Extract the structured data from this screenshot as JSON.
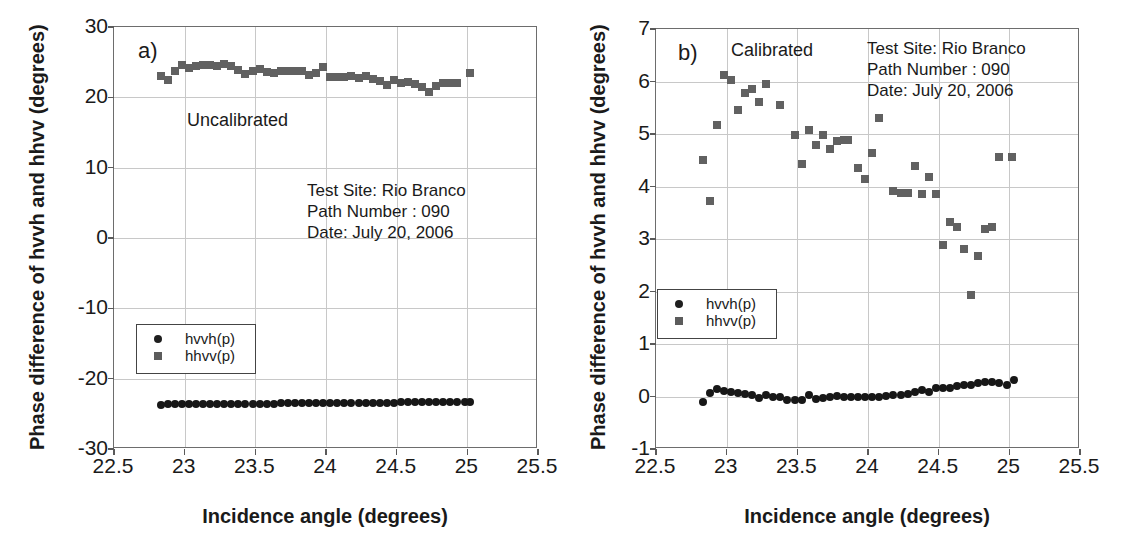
{
  "figure": {
    "background": "#ffffff",
    "marker_color_square": "#616161",
    "marker_color_circle": "#171717",
    "grid_color": "#c8c8c8",
    "frame_color": "#6d6d6d"
  },
  "panels": [
    {
      "id": "a",
      "tag": "a)",
      "state_note": "Uncalibrated",
      "xlabel": "Incidence angle (degrees)",
      "ylabel": "Phase difference of hvvh and hhvv (degrees)",
      "meta": {
        "test_site": "Test Site: Rio Branco",
        "path_number": "Path Number : 090",
        "date": "Date: July 20, 2006"
      },
      "legend": {
        "items": [
          {
            "label": "hvvh(p)",
            "marker": "circle"
          },
          {
            "label": "hhvv(p)",
            "marker": "square"
          }
        ]
      },
      "xticks": [
        "22.5",
        "23",
        "23.5",
        "24",
        "24.5",
        "25",
        "25.5"
      ],
      "yticks": [
        "30",
        "20",
        "10",
        "0",
        "-10",
        "-20",
        "-30"
      ]
    },
    {
      "id": "b",
      "tag": "b)",
      "state_note": "Calibrated",
      "xlabel": "Incidence angle (degrees)",
      "ylabel": "Phase difference of hvvh and hhvv (degrees)",
      "meta": {
        "test_site": "Test Site: Rio Branco",
        "path_number": "Path Number : 090",
        "date": "Date: July 20, 2006"
      },
      "legend": {
        "items": [
          {
            "label": "hvvh(p)",
            "marker": "circle"
          },
          {
            "label": "hhvv(p)",
            "marker": "square"
          }
        ]
      },
      "xticks": [
        "22.5",
        "23",
        "23.5",
        "24",
        "24.5",
        "25",
        "25.5"
      ],
      "yticks": [
        "7",
        "6",
        "5",
        "4",
        "3",
        "2",
        "1",
        "0",
        "-1"
      ]
    }
  ],
  "chart_data": [
    {
      "type": "scatter",
      "panel": "a",
      "title": "a) Uncalibrated",
      "xlabel": "Incidence angle (degrees)",
      "ylabel": "Phase difference of hvvh and hhvv (degrees)",
      "xlim": [
        22.5,
        25.5
      ],
      "ylim": [
        -30,
        30
      ],
      "xticks": [
        22.5,
        23,
        23.5,
        24,
        24.5,
        25,
        25.5
      ],
      "yticks": [
        -30,
        -20,
        -10,
        0,
        10,
        20,
        30
      ],
      "grid": true,
      "legend_position": "lower-left",
      "annotations": [
        "Uncalibrated",
        "Test Site: Rio Branco",
        "Path Number : 090",
        "Date: July 20, 2006"
      ],
      "series": [
        {
          "name": "hhvv(p)",
          "marker": "square",
          "color": "#616161",
          "x": [
            22.83,
            22.88,
            22.93,
            22.98,
            23.03,
            23.08,
            23.13,
            23.18,
            23.23,
            23.28,
            23.33,
            23.38,
            23.43,
            23.48,
            23.53,
            23.58,
            23.63,
            23.68,
            23.73,
            23.78,
            23.83,
            23.88,
            23.93,
            23.98,
            24.03,
            24.08,
            24.13,
            24.18,
            24.23,
            24.28,
            24.33,
            24.38,
            24.43,
            24.48,
            24.53,
            24.58,
            24.63,
            24.68,
            24.73,
            24.78,
            24.83,
            24.88,
            24.93,
            25.02
          ],
          "y": [
            23.1,
            22.4,
            23.8,
            24.6,
            24.2,
            24.5,
            24.6,
            24.6,
            24.4,
            24.7,
            24.4,
            23.9,
            23.3,
            23.7,
            24.0,
            23.6,
            23.4,
            23.7,
            23.8,
            23.8,
            23.8,
            23.2,
            23.4,
            24.3,
            22.9,
            22.9,
            22.9,
            23.0,
            22.8,
            23.0,
            22.6,
            22.3,
            21.8,
            22.5,
            22.1,
            22.2,
            21.9,
            21.4,
            20.8,
            21.6,
            22.0,
            22.0,
            22.1,
            23.4
          ]
        },
        {
          "name": "hvvh(p)",
          "marker": "circle",
          "color": "#171717",
          "x": [
            22.83,
            22.88,
            22.93,
            22.98,
            23.03,
            23.08,
            23.13,
            23.18,
            23.23,
            23.28,
            23.33,
            23.38,
            23.43,
            23.48,
            23.53,
            23.58,
            23.63,
            23.68,
            23.73,
            23.78,
            23.83,
            23.88,
            23.93,
            23.98,
            24.03,
            24.08,
            24.13,
            24.18,
            24.23,
            24.28,
            24.33,
            24.38,
            24.43,
            24.48,
            24.53,
            24.58,
            24.63,
            24.68,
            24.73,
            24.78,
            24.83,
            24.88,
            24.93,
            24.98,
            25.02
          ],
          "y": [
            -23.7,
            -23.6,
            -23.6,
            -23.6,
            -23.6,
            -23.6,
            -23.6,
            -23.6,
            -23.6,
            -23.6,
            -23.6,
            -23.6,
            -23.6,
            -23.6,
            -23.6,
            -23.6,
            -23.6,
            -23.5,
            -23.5,
            -23.5,
            -23.5,
            -23.5,
            -23.5,
            -23.5,
            -23.5,
            -23.5,
            -23.5,
            -23.5,
            -23.4,
            -23.4,
            -23.4,
            -23.4,
            -23.4,
            -23.4,
            -23.3,
            -23.3,
            -23.3,
            -23.3,
            -23.3,
            -23.3,
            -23.3,
            -23.3,
            -23.3,
            -23.3,
            -23.3
          ]
        }
      ]
    },
    {
      "type": "scatter",
      "panel": "b",
      "title": "b) Calibrated",
      "xlabel": "Incidence angle (degrees)",
      "ylabel": "Phase difference of hvvh and hhvv (degrees)",
      "xlim": [
        22.5,
        25.5
      ],
      "ylim": [
        -1,
        7
      ],
      "xticks": [
        22.5,
        23,
        23.5,
        24,
        24.5,
        25,
        25.5
      ],
      "yticks": [
        -1,
        0,
        1,
        2,
        3,
        4,
        5,
        6,
        7
      ],
      "grid": true,
      "legend_position": "lower-left",
      "annotations": [
        "Calibrated",
        "Test Site: Rio Branco",
        "Path Number : 090",
        "Date: July 20, 2006"
      ],
      "series": [
        {
          "name": "hhvv(p)",
          "marker": "square",
          "color": "#616161",
          "x": [
            22.83,
            22.88,
            22.93,
            22.98,
            23.03,
            23.08,
            23.13,
            23.18,
            23.23,
            23.28,
            23.38,
            23.48,
            23.53,
            23.58,
            23.63,
            23.68,
            23.73,
            23.78,
            23.83,
            23.86,
            23.93,
            23.98,
            24.03,
            24.08,
            24.18,
            24.23,
            24.28,
            24.33,
            24.38,
            24.43,
            24.48,
            24.53,
            24.58,
            24.63,
            24.68,
            24.73,
            24.78,
            24.83,
            24.88,
            24.93,
            25.02
          ],
          "y": [
            4.5,
            3.72,
            5.17,
            6.12,
            6.03,
            5.45,
            5.78,
            5.86,
            5.61,
            5.96,
            5.55,
            4.99,
            4.42,
            5.07,
            4.8,
            4.99,
            4.72,
            4.87,
            4.88,
            4.89,
            4.35,
            4.14,
            4.64,
            5.3,
            3.92,
            3.88,
            3.87,
            4.4,
            3.86,
            4.19,
            3.85,
            2.89,
            3.33,
            3.22,
            2.81,
            1.94,
            2.67,
            3.2,
            3.23,
            4.57,
            4.57
          ]
        },
        {
          "name": "hvvh(p)",
          "marker": "circle",
          "color": "#171717",
          "x": [
            22.83,
            22.88,
            22.93,
            22.98,
            23.03,
            23.08,
            23.13,
            23.18,
            23.23,
            23.28,
            23.33,
            23.38,
            23.43,
            23.48,
            23.53,
            23.58,
            23.63,
            23.68,
            23.73,
            23.78,
            23.83,
            23.88,
            23.93,
            23.98,
            24.03,
            24.08,
            24.13,
            24.18,
            24.23,
            24.28,
            24.33,
            24.38,
            24.43,
            24.48,
            24.53,
            24.58,
            24.63,
            24.68,
            24.73,
            24.78,
            24.83,
            24.88,
            24.93,
            24.98,
            25.03
          ],
          "y": [
            -0.1,
            0.06,
            0.15,
            0.1,
            0.08,
            0.06,
            0.04,
            0.03,
            -0.02,
            0.02,
            0.0,
            -0.01,
            -0.07,
            -0.06,
            -0.07,
            0.02,
            -0.04,
            -0.02,
            -0.01,
            0.01,
            0.0,
            -0.01,
            -0.01,
            -0.01,
            0.0,
            0.0,
            0.01,
            0.02,
            0.03,
            0.05,
            0.08,
            0.12,
            0.08,
            0.16,
            0.17,
            0.16,
            0.2,
            0.21,
            0.22,
            0.26,
            0.28,
            0.28,
            0.26,
            0.22,
            0.32
          ]
        }
      ]
    }
  ]
}
